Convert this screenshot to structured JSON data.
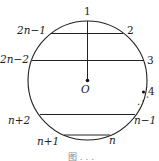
{
  "diagram": {
    "center_label": "O",
    "points": [
      {
        "id": "p1",
        "label": "1"
      },
      {
        "id": "p2",
        "label": "2"
      },
      {
        "id": "p3",
        "label": "3"
      },
      {
        "id": "p4",
        "label": "4"
      },
      {
        "id": "pn1",
        "label": "n−1"
      },
      {
        "id": "pn",
        "label": "n"
      },
      {
        "id": "pnp1",
        "label": "n+1"
      },
      {
        "id": "pnp2",
        "label": "n+2"
      },
      {
        "id": "p2n2",
        "label": "2n−2"
      },
      {
        "id": "p2n1",
        "label": "2n−1"
      }
    ],
    "ellipsis": "⋰",
    "caption": "图 . . ."
  }
}
